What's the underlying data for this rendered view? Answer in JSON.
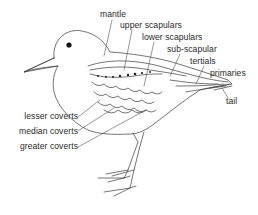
{
  "diagram": {
    "line_color": "#3a3a3a",
    "labels_right": [
      {
        "id": "mantle",
        "text": "mantle"
      },
      {
        "id": "upper-scapulars",
        "text": "upper scapulars"
      },
      {
        "id": "lower-scapulars",
        "text": "lower scapulars"
      },
      {
        "id": "sub-scapular",
        "text": "sub-scapular"
      },
      {
        "id": "tertials",
        "text": "tertials"
      },
      {
        "id": "primaries",
        "text": "primaries"
      },
      {
        "id": "tail",
        "text": "tail"
      }
    ],
    "labels_left": [
      {
        "id": "lesser-coverts",
        "text": "lesser coverts"
      },
      {
        "id": "median-coverts",
        "text": "median coverts"
      },
      {
        "id": "greater-coverts",
        "text": "greater coverts"
      }
    ]
  }
}
